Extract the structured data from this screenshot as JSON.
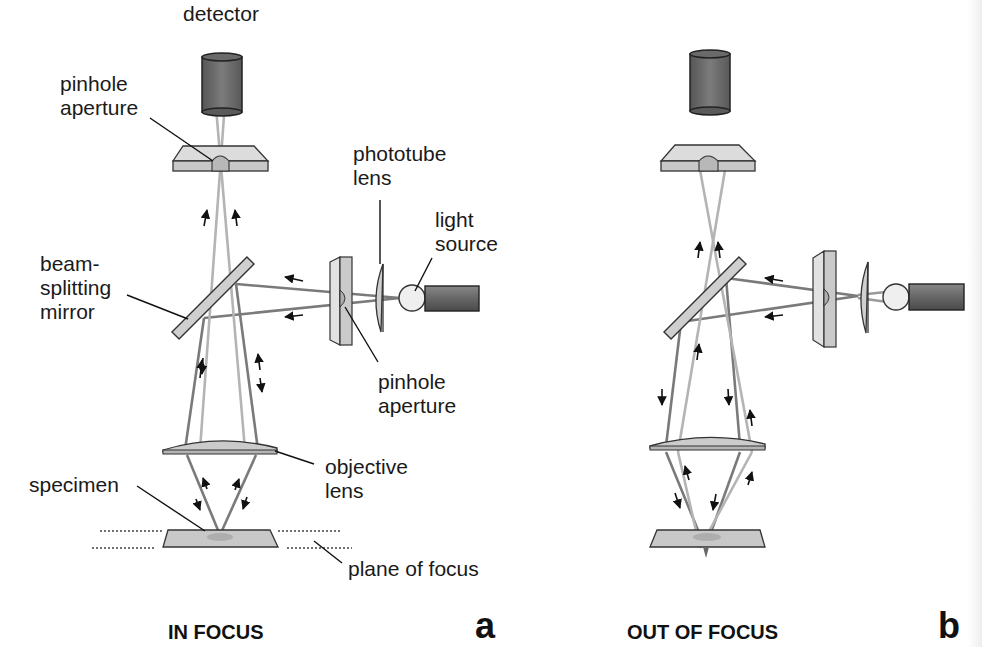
{
  "panels": [
    {
      "id": "a",
      "letter": "a",
      "caption": "IN FOCUS",
      "labels": {
        "detector": "detector",
        "pinhole_top_1": "pinhole",
        "pinhole_top_2": "aperture",
        "phototube_1": "phototube",
        "phototube_2": "lens",
        "light_1": "light",
        "light_2": "source",
        "beam_1": "beam-",
        "beam_2": "splitting",
        "beam_3": "mirror",
        "pinhole_mid_1": "pinhole",
        "pinhole_mid_2": "aperture",
        "objective_1": "objective",
        "objective_2": "lens",
        "specimen": "specimen",
        "plane": "plane of focus"
      }
    },
    {
      "id": "b",
      "letter": "b",
      "caption": "OUT OF FOCUS"
    }
  ],
  "colors": {
    "detector_fill": "#6f6f6f",
    "plate_fill": "#d4d4d4",
    "beam_dark": "#7a7a7a",
    "beam_light": "#b4b4b4",
    "outline": "#333333"
  }
}
